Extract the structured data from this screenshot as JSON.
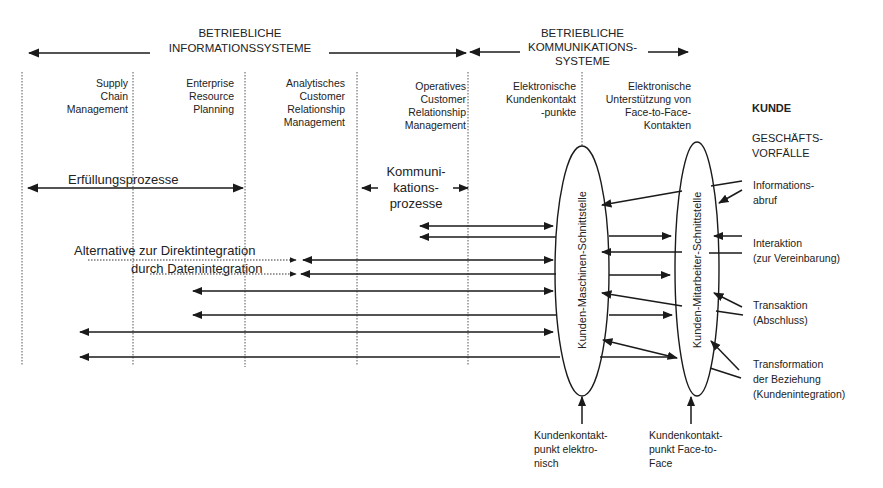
{
  "diagram": {
    "header_left": "BETRIEBLICHE\nINFORMATIONSSYSTEME",
    "header_right": "BETRIEBLICHE\nKOMMUNIKATIONS-\nSYSTEME",
    "columns": [
      {
        "label": "Supply\nChain\nManagement"
      },
      {
        "label": "Enterprise\nResource\nPlanning"
      },
      {
        "label": "Analytisches\nCustomer\nRelationship\nManagement"
      },
      {
        "label": "Operatives\nCustomer\nRelationship\nManagement"
      },
      {
        "label": "Elektronische\nKundenkontakt\n-punkte"
      },
      {
        "label": "Elektronische\nUnterstützung von\nFace-to-Face-\nKontakten"
      }
    ],
    "kunde": "KUNDE",
    "geschaeftsvorfaelle": "GESCHÄFTS-\nVORFÄLLE",
    "erfuellungsprozesse": "Erfüllungsprozesse",
    "kommunikationsprozesse": "Kommuni-\nkations-\nprozesse",
    "alternative_line1": "Alternative zur Direktintegration",
    "alternative_line2": "durch Datenintegration",
    "interface_machine": "Kunden-Maschinen-Schnittstelle",
    "interface_employee": "Kunden-Mitarbeiter-Schnittstelle",
    "business_events": [
      {
        "label": "Informations-\nabruf"
      },
      {
        "label": "Interaktion\n(zur Vereinbarung)"
      },
      {
        "label": "Transaktion\n(Abschluss)"
      },
      {
        "label": "Transformation\nder Beziehung\n(Kundenintegration)"
      }
    ],
    "touchpoint_electronic": "Kundenkontakt-\npunkt elektro-\nnisch",
    "touchpoint_face": "Kundenkontakt-\npunkt Face-to-\nFace",
    "colors": {
      "line": "#1a1a1a",
      "dashed": "#555555",
      "background": "#ffffff"
    }
  }
}
